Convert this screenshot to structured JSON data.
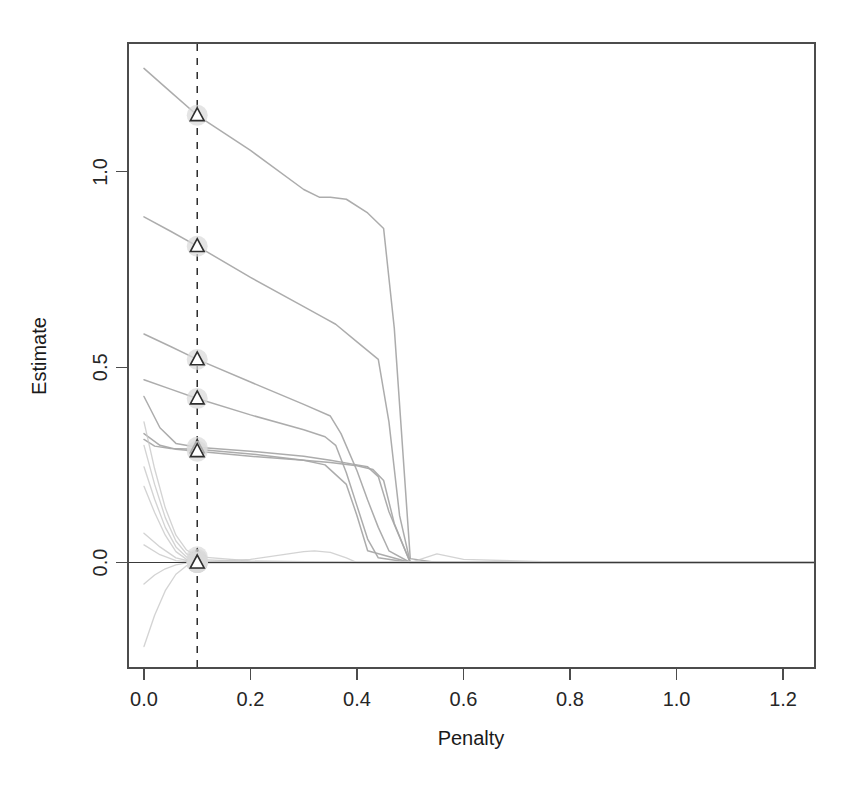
{
  "figure": {
    "background_color": "#ffffff",
    "plot_box": {
      "left": 128,
      "top": 43,
      "right": 815,
      "bottom": 668
    },
    "line_color": "#c8c8c8",
    "line_color_dark": "#a8a8a8",
    "axis_color": "#4c4c4c",
    "marker_color": "#2e2e2e",
    "marker_halo_color": "#d9d9d9",
    "vline_color": "#2b2b2b"
  },
  "chart_data": {
    "type": "line",
    "title": "",
    "subtitle": "",
    "xlabel": "Penalty",
    "ylabel": "Estimate",
    "xlim": [
      -0.03,
      1.26
    ],
    "ylim": [
      -0.27,
      1.33
    ],
    "xticks": [
      0.0,
      0.2,
      0.4,
      0.6,
      0.8,
      1.0,
      1.2
    ],
    "xticklabels": [
      "0.0",
      "0.2",
      "0.4",
      "0.6",
      "0.8",
      "1.0",
      "1.2"
    ],
    "yticks": [
      0.0,
      0.5,
      1.0
    ],
    "yticklabels": [
      "0.0",
      "0.5",
      "1.0"
    ],
    "grid": false,
    "legend": null,
    "legend_position": "none",
    "annotations": {
      "vertical_dashed_line_x": 0.1,
      "horizontal_solid_line_y": 0.0,
      "marker_shape": "triangle",
      "marker_description": "selected-penalty markers on each path at penalty = 0.1"
    },
    "selected_penalty": 0.1,
    "marker_values_at_selected_penalty": [
      1.145,
      0.81,
      0.52,
      0.42,
      0.295,
      0.285,
      0.015,
      0.008,
      0.004,
      0.0,
      0.0,
      0.0,
      0.0,
      0.0,
      0.0
    ],
    "series": [
      {
        "name": "path-1",
        "marker_value": 1.145,
        "x": [
          0.0,
          0.05,
          0.1,
          0.2,
          0.3,
          0.33,
          0.35,
          0.38,
          0.42,
          0.45,
          0.47,
          0.5,
          0.55,
          0.6,
          0.7,
          0.9,
          1.1,
          1.26
        ],
        "y": [
          1.265,
          1.205,
          1.145,
          1.055,
          0.955,
          0.935,
          0.935,
          0.93,
          0.895,
          0.855,
          0.6,
          0.01,
          0.0,
          0.0,
          0.0,
          0.0,
          0.0,
          0.0
        ]
      },
      {
        "name": "path-2",
        "marker_value": 0.81,
        "x": [
          0.0,
          0.05,
          0.1,
          0.2,
          0.3,
          0.34,
          0.36,
          0.4,
          0.44,
          0.46,
          0.48,
          0.5,
          0.6,
          0.8,
          1.0,
          1.26
        ],
        "y": [
          0.885,
          0.848,
          0.81,
          0.73,
          0.655,
          0.625,
          0.61,
          0.565,
          0.52,
          0.36,
          0.12,
          0.0,
          0.0,
          0.0,
          0.0,
          0.0
        ]
      },
      {
        "name": "path-3",
        "marker_value": 0.52,
        "x": [
          0.0,
          0.05,
          0.1,
          0.2,
          0.3,
          0.35,
          0.37,
          0.4,
          0.42,
          0.44,
          0.46,
          0.5,
          0.6,
          0.8,
          1.0,
          1.26
        ],
        "y": [
          0.585,
          0.553,
          0.52,
          0.462,
          0.405,
          0.375,
          0.33,
          0.235,
          0.16,
          0.09,
          0.03,
          0.0,
          0.0,
          0.0,
          0.0,
          0.0
        ]
      },
      {
        "name": "path-4",
        "marker_value": 0.42,
        "x": [
          0.0,
          0.05,
          0.1,
          0.2,
          0.3,
          0.34,
          0.36,
          0.38,
          0.4,
          0.42,
          0.44,
          0.5,
          0.6,
          0.8,
          1.0,
          1.26
        ],
        "y": [
          0.468,
          0.444,
          0.42,
          0.378,
          0.34,
          0.322,
          0.3,
          0.23,
          0.145,
          0.06,
          0.012,
          0.0,
          0.0,
          0.0,
          0.0,
          0.0
        ]
      },
      {
        "name": "path-5",
        "marker_value": 0.295,
        "x": [
          0.0,
          0.03,
          0.06,
          0.1,
          0.2,
          0.3,
          0.35,
          0.4,
          0.42,
          0.44,
          0.46,
          0.5,
          0.6,
          0.8,
          1.0,
          1.26
        ],
        "y": [
          0.425,
          0.345,
          0.305,
          0.295,
          0.285,
          0.272,
          0.262,
          0.25,
          0.245,
          0.22,
          0.13,
          0.0,
          0.0,
          0.0,
          0.0,
          0.0
        ]
      },
      {
        "name": "path-6",
        "marker_value": 0.285,
        "x": [
          0.0,
          0.03,
          0.06,
          0.1,
          0.2,
          0.3,
          0.35,
          0.4,
          0.43,
          0.45,
          0.47,
          0.5,
          0.6,
          0.8,
          1.0,
          1.26
        ],
        "y": [
          0.33,
          0.3,
          0.29,
          0.285,
          0.272,
          0.262,
          0.256,
          0.248,
          0.238,
          0.21,
          0.1,
          0.0,
          0.0,
          0.0,
          0.0,
          0.0
        ]
      },
      {
        "name": "path-7",
        "marker_value": 0.29,
        "x": [
          0.0,
          0.02,
          0.05,
          0.1,
          0.2,
          0.3,
          0.34,
          0.38,
          0.4,
          0.42,
          0.5,
          0.7,
          1.0,
          1.26
        ],
        "y": [
          0.315,
          0.298,
          0.292,
          0.29,
          0.278,
          0.262,
          0.25,
          0.2,
          0.12,
          0.03,
          0.0,
          0.0,
          0.0,
          0.0
        ]
      },
      {
        "name": "path-8",
        "marker_value": 0.015,
        "x": [
          0.0,
          0.02,
          0.04,
          0.06,
          0.08,
          0.1,
          0.2,
          0.4,
          0.6,
          0.8,
          1.0,
          1.26
        ],
        "y": [
          0.36,
          0.24,
          0.14,
          0.07,
          0.032,
          0.015,
          0.004,
          0.0,
          0.0,
          0.0,
          0.0,
          0.0
        ]
      },
      {
        "name": "path-9",
        "marker_value": 0.008,
        "x": [
          0.0,
          0.02,
          0.04,
          0.06,
          0.08,
          0.1,
          0.2,
          0.4,
          0.6,
          0.8,
          1.0,
          1.26
        ],
        "y": [
          0.3,
          0.2,
          0.115,
          0.055,
          0.022,
          0.008,
          0.002,
          0.0,
          0.0,
          0.0,
          0.0,
          0.0
        ]
      },
      {
        "name": "path-10",
        "marker_value": 0.004,
        "x": [
          0.0,
          0.02,
          0.04,
          0.06,
          0.08,
          0.1,
          0.2,
          0.4,
          0.6,
          0.8,
          1.0,
          1.26
        ],
        "y": [
          0.245,
          0.162,
          0.09,
          0.04,
          0.014,
          0.004,
          0.0,
          0.0,
          0.0,
          0.0,
          0.0,
          0.0
        ]
      },
      {
        "name": "path-11",
        "marker_value": 0.0,
        "x": [
          0.0,
          0.02,
          0.04,
          0.06,
          0.08,
          0.1,
          0.2,
          0.4,
          0.6,
          0.8,
          1.0,
          1.26
        ],
        "y": [
          0.195,
          0.128,
          0.07,
          0.028,
          0.008,
          0.0,
          0.0,
          0.0,
          0.0,
          0.0,
          0.0,
          0.0
        ]
      },
      {
        "name": "path-12",
        "marker_value": 0.0,
        "x": [
          0.0,
          0.03,
          0.06,
          0.09,
          0.1,
          0.2,
          0.3,
          0.32,
          0.35,
          0.38,
          0.4,
          0.5,
          0.55,
          0.6,
          0.8,
          1.0,
          1.26
        ],
        "y": [
          0.075,
          0.04,
          0.012,
          0.002,
          0.0,
          0.008,
          0.028,
          0.03,
          0.026,
          0.012,
          0.0,
          0.0,
          0.022,
          0.008,
          0.0,
          0.0,
          0.0
        ]
      },
      {
        "name": "path-13",
        "marker_value": 0.0,
        "x": [
          0.0,
          0.03,
          0.06,
          0.1,
          0.2,
          0.4,
          0.6,
          0.8,
          1.0,
          1.26
        ],
        "y": [
          0.045,
          0.02,
          0.005,
          0.0,
          0.0,
          0.0,
          0.0,
          0.0,
          0.0,
          0.0
        ]
      },
      {
        "name": "path-14",
        "marker_value": 0.0,
        "x": [
          0.0,
          0.02,
          0.04,
          0.06,
          0.08,
          0.1,
          0.2,
          0.4,
          0.6,
          0.8,
          1.0,
          1.26
        ],
        "y": [
          -0.055,
          -0.032,
          -0.016,
          -0.006,
          -0.001,
          0.0,
          0.0,
          0.0,
          0.0,
          0.0,
          0.0,
          0.0
        ]
      },
      {
        "name": "path-15",
        "marker_value": 0.0,
        "x": [
          0.0,
          0.02,
          0.04,
          0.06,
          0.08,
          0.1,
          0.2,
          0.4,
          0.6,
          0.8,
          1.0,
          1.26
        ],
        "y": [
          -0.215,
          -0.135,
          -0.072,
          -0.03,
          -0.008,
          0.0,
          0.0,
          0.0,
          0.0,
          0.0,
          0.0,
          0.0
        ]
      }
    ]
  }
}
